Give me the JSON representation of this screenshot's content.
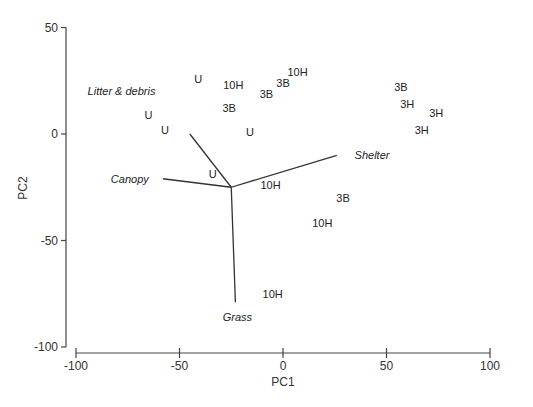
{
  "chart_data": {
    "type": "scatter",
    "subtype": "pca-biplot",
    "title": "",
    "xlabel": "PC1",
    "ylabel": "PC2",
    "xlim": [
      -100,
      100
    ],
    "ylim": [
      -100,
      50
    ],
    "xticks": [
      -100,
      -50,
      0,
      50,
      100
    ],
    "yticks": [
      -100,
      -50,
      0,
      50
    ],
    "grid": false,
    "legend": null,
    "points": [
      {
        "label": "U",
        "x": -65,
        "y": 9
      },
      {
        "label": "U",
        "x": -57,
        "y": 2
      },
      {
        "label": "U",
        "x": -41,
        "y": 26
      },
      {
        "label": "10H",
        "x": -24,
        "y": 23
      },
      {
        "label": "3B",
        "x": -26,
        "y": 12
      },
      {
        "label": "U",
        "x": -16,
        "y": 1
      },
      {
        "label": "3B",
        "x": -8,
        "y": 19
      },
      {
        "label": "3B",
        "x": 0,
        "y": 24
      },
      {
        "label": "10H",
        "x": 7,
        "y": 29
      },
      {
        "label": "3B",
        "x": 57,
        "y": 22
      },
      {
        "label": "3H",
        "x": 60,
        "y": 14
      },
      {
        "label": "3H",
        "x": 74,
        "y": 10
      },
      {
        "label": "3H",
        "x": 67,
        "y": 2
      },
      {
        "label": "U",
        "x": -34,
        "y": -19
      },
      {
        "label": "10H",
        "x": -6,
        "y": -24
      },
      {
        "label": "3B",
        "x": 29,
        "y": -30
      },
      {
        "label": "10H",
        "x": 19,
        "y": -42
      },
      {
        "label": "10H",
        "x": -5,
        "y": -75
      }
    ],
    "vectors": {
      "origin": [
        -25,
        -25
      ],
      "items": [
        {
          "label": "Litter & debris",
          "end": [
            -45,
            0
          ],
          "label_pos": [
            -78,
            20
          ]
        },
        {
          "label": "Canopy",
          "end": [
            -58,
            -21
          ],
          "label_pos": [
            -74,
            -21
          ]
        },
        {
          "label": "Shelter",
          "end": [
            26,
            -10
          ],
          "label_pos": [
            43,
            -10
          ]
        },
        {
          "label": "Grass",
          "end": [
            -23,
            -79
          ],
          "label_pos": [
            -22,
            -86
          ]
        }
      ]
    }
  }
}
